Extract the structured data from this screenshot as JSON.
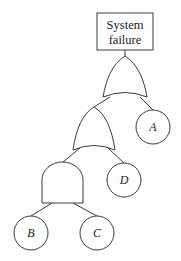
{
  "diagram": {
    "type": "fault-tree",
    "top_event": {
      "line1": "System",
      "line2": "failure"
    },
    "gates": [
      {
        "id": "or-top",
        "kind": "OR",
        "inputs": [
          "or-mid",
          "A"
        ]
      },
      {
        "id": "or-mid",
        "kind": "OR",
        "inputs": [
          "and-bottom",
          "D"
        ]
      },
      {
        "id": "and-bottom",
        "kind": "AND",
        "inputs": [
          "B",
          "C"
        ]
      }
    ],
    "basic_events": {
      "A": "A",
      "B": "B",
      "C": "C",
      "D": "D"
    }
  }
}
